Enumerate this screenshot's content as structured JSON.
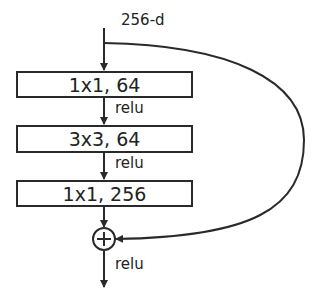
{
  "diagram": {
    "input_label": "256-d",
    "layers": [
      {
        "label": "1x1, 64",
        "activation": "relu"
      },
      {
        "label": "3x3, 64",
        "activation": "relu"
      },
      {
        "label": "1x1, 256"
      }
    ],
    "add_symbol": "+",
    "output_activation": "relu",
    "colors": {
      "stroke": "#2a2a2a",
      "background": "#ffffff"
    }
  }
}
